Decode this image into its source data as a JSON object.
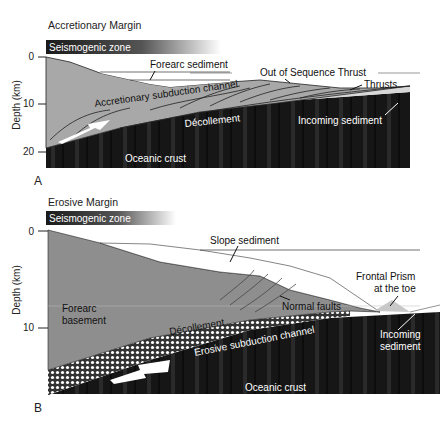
{
  "panel_a": {
    "letter": "A",
    "title": "Accretionary Margin",
    "seismogenic_label": "Seismogenic zone",
    "y_axis_label": "Depth (km)",
    "y_ticks": [
      "0",
      "10",
      "20"
    ],
    "labels": {
      "forearc_sediment": "Forearc sediment",
      "out_of_sequence_thrust": "Out of Sequence Thrust",
      "thrusts": "Thrusts",
      "accretionary_channel": "Accretionary subduction channel",
      "decollement": "Décollement",
      "incoming_sediment": "Incoming sediment",
      "oceanic_crust": "Oceanic crust"
    }
  },
  "panel_b": {
    "letter": "B",
    "title": "Erosive Margin",
    "seismogenic_label": "Seismogenic zone",
    "y_axis_label": "Depth (km)",
    "y_ticks": [
      "0",
      "10"
    ],
    "labels": {
      "slope_sediment": "Slope sediment",
      "frontal_prism_1": "Frontal Prism",
      "frontal_prism_2": "at the toe",
      "forearc_basement_1": "Forearc",
      "forearc_basement_2": "basement",
      "normal_faults": "Normal faults",
      "decollement": "Décollement",
      "erosive_channel": "Erosive subduction channel",
      "incoming_sediment_1": "Incoming",
      "incoming_sediment_2": "sediment",
      "oceanic_crust": "Oceanic crust"
    }
  },
  "caption": "FIGURE 3   Schematic structure of (A) accretionary and (B) erosive margins."
}
